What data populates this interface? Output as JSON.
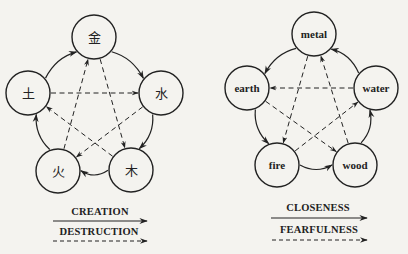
{
  "diagrams": [
    {
      "name": "chinese-five-elements",
      "nodes": [
        {
          "id": "metal",
          "label": "金",
          "cx": 94,
          "cy": 37
        },
        {
          "id": "water",
          "label": "水",
          "cx": 161,
          "cy": 93
        },
        {
          "id": "wood",
          "label": "木",
          "cx": 131,
          "cy": 170
        },
        {
          "id": "fire",
          "label": "火",
          "cx": 58,
          "cy": 171
        },
        {
          "id": "earth",
          "label": "土",
          "cx": 28,
          "cy": 93
        }
      ],
      "solid_edges": [
        {
          "from": "metal",
          "to": "water"
        },
        {
          "from": "water",
          "to": "wood"
        },
        {
          "from": "wood",
          "to": "fire"
        },
        {
          "from": "fire",
          "to": "earth"
        },
        {
          "from": "earth",
          "to": "metal"
        }
      ],
      "dashed_edges": [
        {
          "from": "earth",
          "to": "water"
        },
        {
          "from": "water",
          "to": "fire"
        },
        {
          "from": "fire",
          "to": "metal"
        },
        {
          "from": "metal",
          "to": "wood"
        },
        {
          "from": "wood",
          "to": "earth"
        }
      ],
      "legend": {
        "solid_label": "CREATION",
        "dashed_label": "DESTRUCTION"
      }
    },
    {
      "name": "english-five-elements",
      "nodes": [
        {
          "id": "metal",
          "label": "metal",
          "cx": 314,
          "cy": 34
        },
        {
          "id": "water",
          "label": "water",
          "cx": 376,
          "cy": 88
        },
        {
          "id": "wood",
          "label": "wood",
          "cx": 355,
          "cy": 165
        },
        {
          "id": "fire",
          "label": "fire",
          "cx": 277,
          "cy": 165
        },
        {
          "id": "earth",
          "label": "earth",
          "cx": 247,
          "cy": 88
        }
      ],
      "solid_edges": [
        {
          "from": "metal",
          "to": "earth"
        },
        {
          "from": "earth",
          "to": "fire"
        },
        {
          "from": "fire",
          "to": "wood"
        },
        {
          "from": "wood",
          "to": "water"
        },
        {
          "from": "water",
          "to": "metal"
        }
      ],
      "dashed_edges": [
        {
          "from": "water",
          "to": "earth"
        },
        {
          "from": "earth",
          "to": "wood"
        },
        {
          "from": "wood",
          "to": "metal"
        },
        {
          "from": "metal",
          "to": "fire"
        },
        {
          "from": "fire",
          "to": "water"
        }
      ],
      "legend": {
        "solid_label": "CLOSENESS",
        "dashed_label": "FEARFULNESS"
      }
    }
  ],
  "colors": {
    "background": "#f4f3ef",
    "ink": "#222222"
  }
}
